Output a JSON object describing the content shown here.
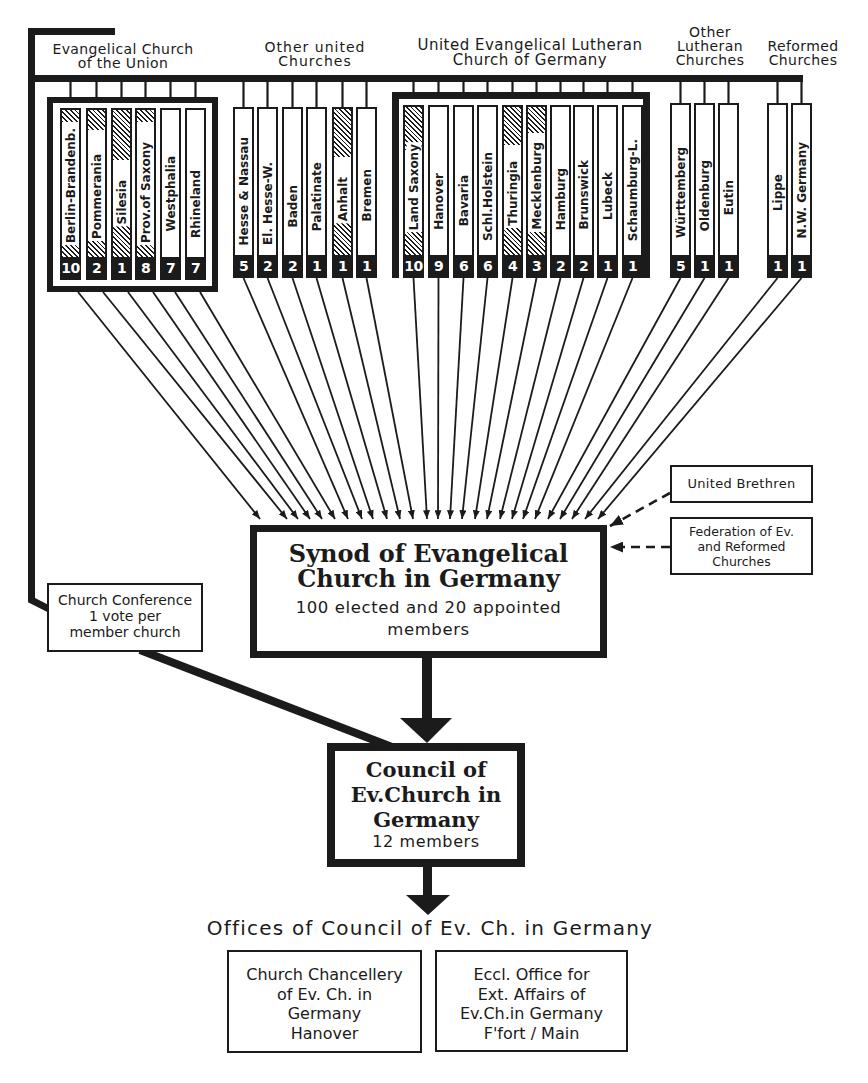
{
  "groups": [
    {
      "label_lines": [
        "Evangelical Church",
        "of the Union"
      ],
      "churches": [
        {
          "name": "Berlin-Brandenb.",
          "votes": "10",
          "shaded": true
        },
        {
          "name": "Pommerania",
          "votes": "2",
          "shaded": true
        },
        {
          "name": "Silesia",
          "votes": "1",
          "shaded": true
        },
        {
          "name": "Prov.of Saxony",
          "votes": "8",
          "shaded": true
        },
        {
          "name": "Westphalia",
          "votes": "7",
          "shaded": false
        },
        {
          "name": "Rhineland",
          "votes": "7",
          "shaded": false
        }
      ]
    },
    {
      "label_lines": [
        "Other united",
        "Churches"
      ],
      "churches": [
        {
          "name": "Hesse & Nassau",
          "votes": "5",
          "shaded": false
        },
        {
          "name": "El. Hesse-W.",
          "votes": "2",
          "shaded": false
        },
        {
          "name": "Baden",
          "votes": "2",
          "shaded": false
        },
        {
          "name": "Palatinate",
          "votes": "1",
          "shaded": false
        },
        {
          "name": "Anhalt",
          "votes": "1",
          "shaded": true
        },
        {
          "name": "Bremen",
          "votes": "1",
          "shaded": false
        }
      ]
    },
    {
      "label_lines": [
        "United Evangelical Lutheran",
        "Church of Germany"
      ],
      "churches": [
        {
          "name": "Land Saxony",
          "votes": "10",
          "shaded": true
        },
        {
          "name": "Hanover",
          "votes": "9",
          "shaded": false
        },
        {
          "name": "Bavaria",
          "votes": "6",
          "shaded": false
        },
        {
          "name": "Schl.Holstein",
          "votes": "6",
          "shaded": false
        },
        {
          "name": "Thuringia",
          "votes": "4",
          "shaded": true
        },
        {
          "name": "Mecklenburg",
          "votes": "3",
          "shaded": true
        },
        {
          "name": "Hamburg",
          "votes": "2",
          "shaded": false
        },
        {
          "name": "Brunswick",
          "votes": "2",
          "shaded": false
        },
        {
          "name": "Lubeck",
          "votes": "1",
          "shaded": false
        },
        {
          "name": "Schaumburg-L.",
          "votes": "1",
          "shaded": false
        }
      ]
    },
    {
      "label_lines": [
        "Other",
        "Lutheran",
        "Churches"
      ],
      "churches": [
        {
          "name": "Württemberg",
          "votes": "5",
          "shaded": false
        },
        {
          "name": "Oldenburg",
          "votes": "1",
          "shaded": false
        },
        {
          "name": "Eutin",
          "votes": "1",
          "shaded": false
        }
      ]
    },
    {
      "label_lines": [
        "Reformed",
        "Churches"
      ],
      "churches": [
        {
          "name": "Lippe",
          "votes": "1",
          "shaded": false
        },
        {
          "name": "N.W. Germany",
          "votes": "1",
          "shaded": false
        }
      ]
    }
  ],
  "synod": {
    "title_lines": [
      "Synod of Evangelical",
      "Church in Germany"
    ],
    "subtitle_lines": [
      "100 elected and 20 appointed",
      "members"
    ]
  },
  "external_bodies": [
    {
      "lines": [
        "United Brethren"
      ]
    },
    {
      "lines": [
        "Federation of Ev.",
        "and Reformed",
        "Churches"
      ]
    }
  ],
  "church_conference": {
    "lines": [
      "Church Conference",
      "1 vote per",
      "member church"
    ]
  },
  "council": {
    "title_lines": [
      "Council of",
      "Ev.Church in",
      "Germany"
    ],
    "members": "12 members"
  },
  "offices": {
    "title": "Offices of Council of Ev. Ch. in Germany",
    "boxes": [
      {
        "lines": [
          "Church Chancellery",
          "of Ev. Ch. in",
          "Germany",
          "Hanover"
        ]
      },
      {
        "lines": [
          "Eccl. Office for",
          "Ext. Affairs of",
          "Ev.Ch.in Germany",
          "F'fort / Main"
        ]
      }
    ]
  }
}
